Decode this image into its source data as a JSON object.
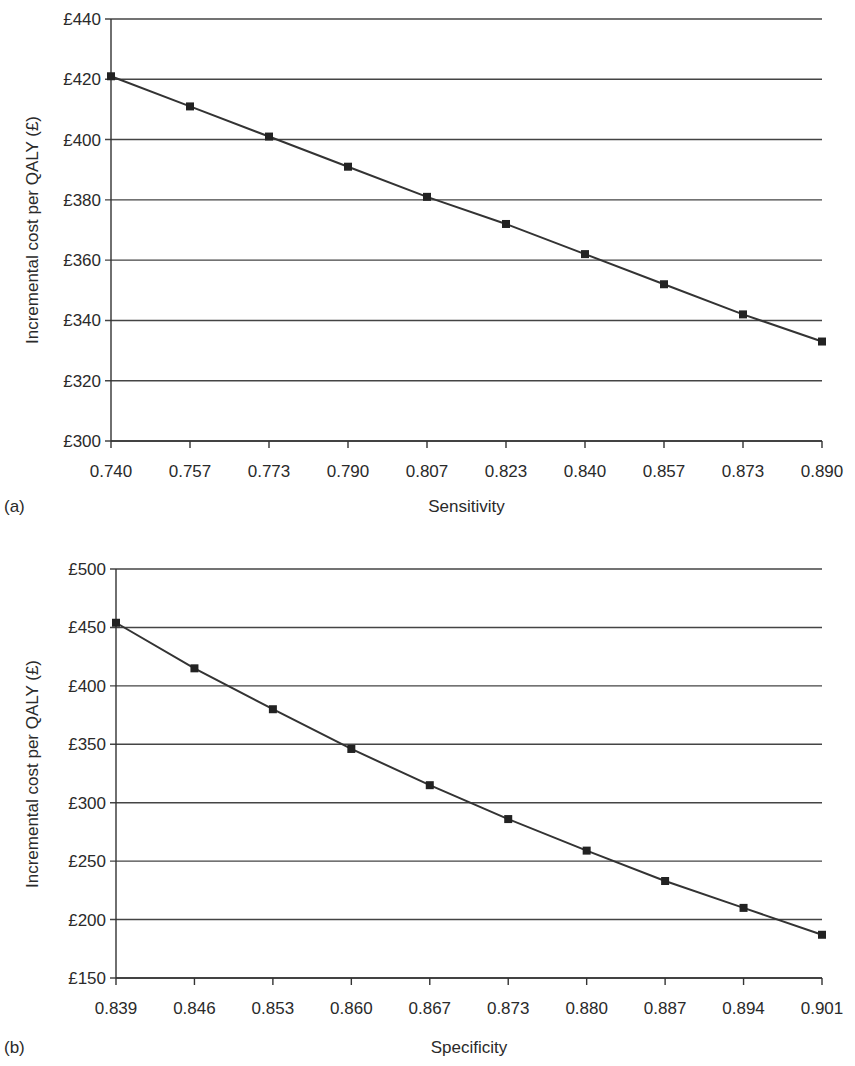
{
  "chart_data": [
    {
      "type": "line",
      "panel_label": "(a)",
      "title": "",
      "xlabel": "Sensitivity",
      "ylabel": "Incremental cost per QALY (£)",
      "categories": [
        "0.740",
        "0.757",
        "0.773",
        "0.790",
        "0.807",
        "0.823",
        "0.840",
        "0.857",
        "0.873",
        "0.890"
      ],
      "values": [
        421,
        411,
        401,
        391,
        381,
        372,
        362,
        352,
        342,
        333
      ],
      "y_ticks": [
        "£300",
        "£320",
        "£340",
        "£360",
        "£380",
        "£400",
        "£420",
        "£440"
      ],
      "ylim": [
        300,
        440
      ],
      "y_step": 20,
      "grid": true,
      "marker": "square",
      "legend": null
    },
    {
      "type": "line",
      "panel_label": "(b)",
      "title": "",
      "xlabel": "Specificity",
      "ylabel": "Incremental cost per QALY (£)",
      "categories": [
        "0.839",
        "0.846",
        "0.853",
        "0.860",
        "0.867",
        "0.873",
        "0.880",
        "0.887",
        "0.894",
        "0.901"
      ],
      "values": [
        454,
        415,
        380,
        346,
        315,
        286,
        259,
        233,
        210,
        187
      ],
      "y_ticks": [
        "£150",
        "£200",
        "£250",
        "£300",
        "£350",
        "£400",
        "£450",
        "£500"
      ],
      "ylim": [
        150,
        500
      ],
      "y_step": 50,
      "grid": true,
      "marker": "square",
      "legend": null
    }
  ]
}
